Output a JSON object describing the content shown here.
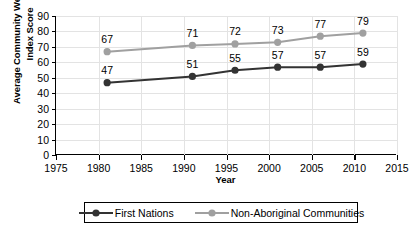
{
  "chart_data": {
    "type": "line",
    "title": "",
    "xlabel": "Year",
    "ylabel": "Average Community Well-being Index Score",
    "x": [
      1981,
      1991,
      1996,
      2001,
      2006,
      2011
    ],
    "xlim": [
      1975,
      2015
    ],
    "ylim": [
      0,
      90
    ],
    "xticks": [
      1975,
      1980,
      1985,
      1990,
      1995,
      2000,
      2005,
      2010,
      2015
    ],
    "yticks": [
      0,
      10,
      20,
      30,
      40,
      50,
      60,
      70,
      80,
      90
    ],
    "grid": "both",
    "legend_position": "bottom",
    "series": [
      {
        "name": "First Nations",
        "color": "#333333",
        "values": [
          47,
          51,
          55,
          57,
          57,
          59
        ],
        "labels": [
          "47",
          "51",
          "55",
          "57",
          "57",
          "59"
        ]
      },
      {
        "name": "Non-Aboriginal Communities",
        "color": "#a0a0a0",
        "values": [
          67,
          71,
          72,
          73,
          77,
          79
        ],
        "labels": [
          "67",
          "71",
          "72",
          "73",
          "77",
          "79"
        ]
      }
    ]
  },
  "axes": {
    "y_title_line1": "Average Community Well-being",
    "y_title_line2": "Index Score",
    "x_title": "Year",
    "y_tick_labels": [
      "90",
      "80",
      "70",
      "60",
      "50",
      "40",
      "30",
      "20",
      "10",
      "0"
    ],
    "x_tick_labels": [
      "1975",
      "1980",
      "1985",
      "1990",
      "1995",
      "2000",
      "2005",
      "2010",
      "2015"
    ]
  },
  "legend": {
    "entries": [
      {
        "label": "First Nations",
        "color": "#333333"
      },
      {
        "label": "Non-Aboriginal Communities",
        "color": "#a0a0a0"
      }
    ]
  }
}
